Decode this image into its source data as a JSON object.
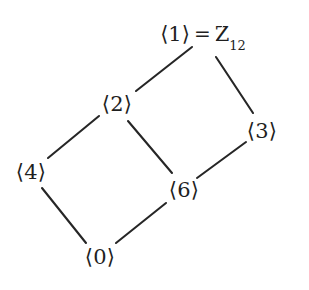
{
  "figure": {
    "kind": "hasse-diagram",
    "background_color": "#ffffff",
    "line_color": "#262626",
    "text_color": "#1f1f1f"
  },
  "nodes": [
    {
      "id": "g1",
      "label": "⟨1⟩",
      "x": 203,
      "y": 36,
      "extra_equals": "=",
      "extra_symbol": "Z",
      "extra_subscript": "12"
    },
    {
      "id": "g2",
      "label": "⟨2⟩",
      "x": 117,
      "y": 104
    },
    {
      "id": "g3",
      "label": "⟨3⟩",
      "x": 262,
      "y": 131
    },
    {
      "id": "g4",
      "label": "⟨4⟩",
      "x": 31,
      "y": 172
    },
    {
      "id": "g6",
      "label": "⟨6⟩",
      "x": 184,
      "y": 190
    },
    {
      "id": "g0",
      "label": "⟨0⟩",
      "x": 100,
      "y": 257
    }
  ],
  "edges": [
    {
      "id": "e-2-1",
      "from": "g2",
      "to": "g1",
      "x1": 136,
      "y1": 91,
      "x2": 192,
      "y2": 47
    },
    {
      "id": "e-1-3",
      "from": "g1",
      "to": "g3",
      "x1": 216,
      "y1": 57,
      "x2": 253,
      "y2": 113
    },
    {
      "id": "e-4-2",
      "from": "g4",
      "to": "g2",
      "x1": 48,
      "y1": 158,
      "x2": 99,
      "y2": 116
    },
    {
      "id": "e-2-6",
      "from": "g2",
      "to": "g6",
      "x1": 128,
      "y1": 121,
      "x2": 172,
      "y2": 173
    },
    {
      "id": "e-6-3",
      "from": "g6",
      "to": "g3",
      "x1": 197,
      "y1": 178,
      "x2": 246,
      "y2": 142
    },
    {
      "id": "e-4-0",
      "from": "g4",
      "to": "g0",
      "x1": 42,
      "y1": 188,
      "x2": 86,
      "y2": 243
    },
    {
      "id": "e-0-6",
      "from": "g0",
      "to": "g6",
      "x1": 116,
      "y1": 243,
      "x2": 166,
      "y2": 203
    }
  ],
  "top_node": {
    "bracket_label": "⟨1⟩",
    "equals": "=",
    "group_symbol": "Z",
    "subscript": "12",
    "x": 203,
    "y": 36
  },
  "labels": {
    "g2": "⟨2⟩",
    "g3": "⟨3⟩",
    "g4": "⟨4⟩",
    "g6": "⟨6⟩",
    "g0": "⟨0⟩"
  }
}
